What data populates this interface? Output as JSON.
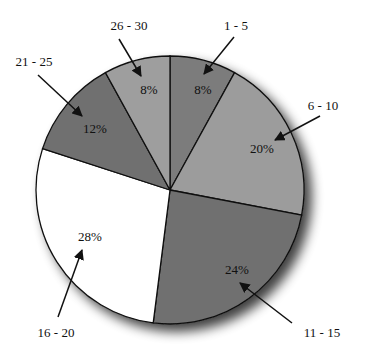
{
  "chart_data": {
    "type": "pie",
    "title": "",
    "start_angle_deg": 0,
    "direction": "clockwise",
    "categories": [
      "1 - 5",
      "6 - 10",
      "11 - 15",
      "16 - 20",
      "21 - 25",
      "26 - 30"
    ],
    "values": [
      8,
      20,
      24,
      28,
      12,
      8
    ],
    "value_labels": [
      "8%",
      "20%",
      "24%",
      "28%",
      "12%",
      "8%"
    ],
    "colors": [
      "#7b7b7b",
      "#9c9c9c",
      "#6f6f6f",
      "#ffffff",
      "#707070",
      "#9e9e9e"
    ],
    "legend": "none (callout labels with arrows)",
    "shadow": true
  },
  "slices": [
    {
      "category": "1 - 5",
      "percent": "8%"
    },
    {
      "category": "6 - 10",
      "percent": "20%"
    },
    {
      "category": "11 - 15",
      "percent": "24%"
    },
    {
      "category": "16 - 20",
      "percent": "28%"
    },
    {
      "category": "21 - 25",
      "percent": "12%"
    },
    {
      "category": "26 - 30",
      "percent": "8%"
    }
  ]
}
